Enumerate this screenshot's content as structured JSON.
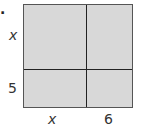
{
  "problem_number": ".",
  "diagram": {
    "type": "area-model",
    "left_labels": [
      "x",
      "5"
    ],
    "bottom_labels": [
      "x",
      "6"
    ],
    "fill_color": "#d8d8d8",
    "line_color": "#222222"
  }
}
